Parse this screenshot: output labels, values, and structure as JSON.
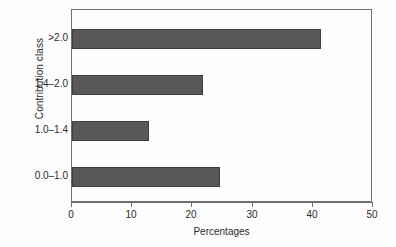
{
  "chart_data": {
    "type": "bar",
    "orientation": "horizontal",
    "title": "",
    "xlabel": "Percentages",
    "ylabel": "Contribution class",
    "categories": [
      ">2.0",
      "1.4–2.0",
      "1.0–1.4",
      "0.0–1.0"
    ],
    "values": [
      41.3,
      21.8,
      12.8,
      24.6
    ],
    "xlim": [
      0,
      50
    ],
    "xticks": [
      0,
      10,
      20,
      30,
      40,
      50
    ],
    "xtick_labels": [
      "0",
      "10",
      "20",
      "30",
      "40",
      "50"
    ],
    "grid": false,
    "legend": false,
    "bar_color": "#585858",
    "bar_edge_color": "#3f3f3f",
    "axis_color": "#6e6e6e",
    "background_color": "#fdfdfd"
  }
}
